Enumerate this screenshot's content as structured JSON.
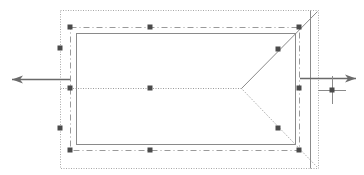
{
  "canvas": {
    "width": 364,
    "height": 175,
    "background": "#ffffff"
  },
  "colors": {
    "line": "#8a8a8a",
    "handle": "#4a4a4a",
    "arrow": "#6a6a6a",
    "dotted": "#a8a8a8"
  },
  "shapes": {
    "outer_dotted_rect": {
      "x": 60,
      "y": 10,
      "w": 258,
      "h": 158
    },
    "handle_rect": {
      "x": 70,
      "y": 27,
      "w": 229,
      "h": 123
    },
    "inner_rect": {
      "x": 76,
      "y": 33,
      "w": 219,
      "h": 111
    },
    "right_edge_line": {
      "x": 310,
      "y1": 10,
      "y2": 168
    },
    "center_line": {
      "x1": 60,
      "y1": 88,
      "x2": 241,
      "y2": 88
    },
    "diag_solid": {
      "x1": 241,
      "y1": 88,
      "x2": 317,
      "y2": 11
    },
    "diag_dotted": {
      "x1": 241,
      "y1": 88,
      "x2": 317,
      "y2": 167
    }
  },
  "handles": [
    {
      "x": 70,
      "y": 27
    },
    {
      "x": 150,
      "y": 27
    },
    {
      "x": 299,
      "y": 27
    },
    {
      "x": 60,
      "y": 48
    },
    {
      "x": 70,
      "y": 88
    },
    {
      "x": 150,
      "y": 88
    },
    {
      "x": 299,
      "y": 88
    },
    {
      "x": 60,
      "y": 128
    },
    {
      "x": 70,
      "y": 150
    },
    {
      "x": 150,
      "y": 150
    },
    {
      "x": 299,
      "y": 150
    },
    {
      "x": 278,
      "y": 49
    },
    {
      "x": 278,
      "y": 128
    },
    {
      "x": 332,
      "y": 90
    }
  ],
  "arrows": {
    "left": {
      "x1": 70,
      "y1": 79,
      "x2": 12,
      "y2": 79
    },
    "right": {
      "x1": 300,
      "y1": 78,
      "x2": 356,
      "y2": 78
    }
  },
  "crosshair": {
    "x": 332,
    "y": 90,
    "size": 14
  },
  "caption": ""
}
